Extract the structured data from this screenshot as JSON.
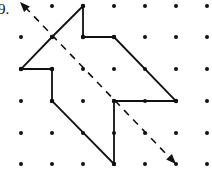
{
  "problem": {
    "number_label": "9.",
    "description": "Arrow-shaped polygon on a dot grid with a dashed line of symmetry (reflection line) drawn diagonally with arrowheads at both ends"
  },
  "grid": {
    "columns_x": [
      21,
      52,
      83,
      114,
      145,
      176,
      207
    ],
    "rows_y": [
      6,
      37,
      69,
      101,
      133,
      164
    ],
    "dot_color": "#111111"
  },
  "shape": {
    "stroke_color": "#111111",
    "vertices": [
      [
        83,
        6
      ],
      [
        83,
        37
      ],
      [
        114,
        37
      ],
      [
        176,
        101
      ],
      [
        114,
        101
      ],
      [
        114,
        164
      ],
      [
        52,
        101
      ],
      [
        52,
        69
      ],
      [
        21,
        69
      ],
      [
        52,
        37
      ]
    ]
  },
  "symmetry_line": {
    "style": "dashed",
    "from": [
      20,
      2
    ],
    "to": [
      176,
      164
    ],
    "arrowheads": "both"
  }
}
